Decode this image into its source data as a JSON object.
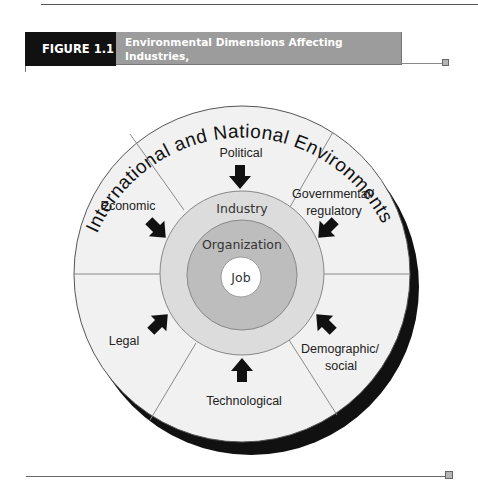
{
  "figure": {
    "label": "FIGURE 1.1",
    "title_line1": "Environmental Dimensions Affecting Industries,",
    "title_line2": "Organizations, and Jobs",
    "colors": {
      "label_bg": "#111111",
      "title_bg": "#9c9c9c",
      "outer_circle": "#f1f1f1",
      "industry_ring": "#dcdcdc",
      "organization_ring": "#bdbdbd",
      "job_circle": "#ffffff",
      "shadow": "#111111"
    }
  },
  "diagram": {
    "outer_arc_label": "International and National Environments",
    "segments": [
      {
        "label_lines": [
          "Political"
        ],
        "arrow_direction": "down"
      },
      {
        "label_lines": [
          "Governmental/",
          "regulatory"
        ],
        "arrow_direction": "down-left"
      },
      {
        "label_lines": [
          "Demographic/",
          "social"
        ],
        "arrow_direction": "up-left"
      },
      {
        "label_lines": [
          "Technological"
        ],
        "arrow_direction": "up"
      },
      {
        "label_lines": [
          "Legal"
        ],
        "arrow_direction": "up-right"
      },
      {
        "label_lines": [
          "Economic"
        ],
        "arrow_direction": "down-right"
      }
    ],
    "rings": {
      "industry": "Industry",
      "organization": "Organization",
      "job": "Job"
    }
  }
}
